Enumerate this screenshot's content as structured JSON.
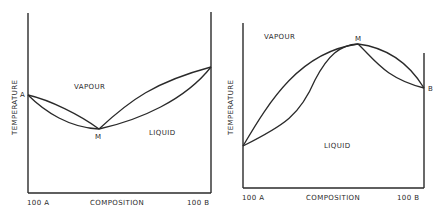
{
  "diagrams": [
    {
      "id": "minimum-boiling-azeotrope",
      "y_axis_label": "TEMPERATURE",
      "x_axis_label": "COMPOSITION",
      "x_left_label": "100 A",
      "x_right_label": "100 B",
      "region_upper": "VAPOUR",
      "region_lower": "LIQUID",
      "point_left": "A",
      "point_azeotrope": "M"
    },
    {
      "id": "maximum-boiling-azeotrope",
      "y_axis_label": "TEMPERATURE",
      "x_axis_label": "COMPOSITION",
      "x_left_label": "100 A",
      "x_right_label": "100 B",
      "region_upper": "VAPOUR",
      "region_lower": "LIQUID",
      "point_right": "B",
      "point_azeotrope": "M"
    }
  ]
}
